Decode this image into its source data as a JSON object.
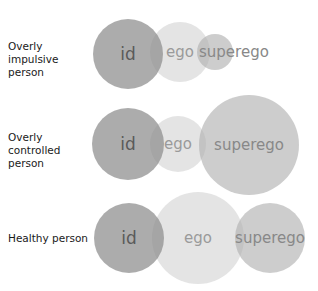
{
  "rows": [
    {
      "label": "Overly impulsive person",
      "label_lines": [
        "Overly impulsive",
        "person"
      ],
      "circles": {
        "id": {
          "text": "id",
          "cx": 128,
          "cy": 54,
          "r": 35
        },
        "ego": {
          "text": "ego",
          "cx": 180,
          "cy": 52,
          "r": 30
        },
        "superego": {
          "text": "superego",
          "cx": 215,
          "cy": 52,
          "r": 18
        }
      }
    },
    {
      "label": "Overly controlled person",
      "label_lines": [
        "Overly controlled",
        "person"
      ],
      "circles": {
        "id": {
          "text": "id",
          "cx": 128,
          "cy": 144,
          "r": 36
        },
        "ego": {
          "text": "ego",
          "cx": 178,
          "cy": 144,
          "r": 28
        },
        "superego": {
          "text": "superego",
          "cx": 249,
          "cy": 145,
          "r": 50
        }
      }
    },
    {
      "label": "Healthy person",
      "label_lines": [
        "Healthy person"
      ],
      "circles": {
        "id": {
          "text": "id",
          "cx": 129,
          "cy": 238,
          "r": 35
        },
        "ego": {
          "text": "ego",
          "cx": 198,
          "cy": 238,
          "r": 46
        },
        "superego": {
          "text": "superego",
          "cx": 270,
          "cy": 238,
          "r": 35
        }
      }
    }
  ],
  "colors": {
    "id_fill": "#8c8c8c",
    "ego_fill": "#e6e6e6",
    "superego_fill": "#c4c4c4",
    "id_text": "#5a5a5a",
    "ego_text": "#9a9a9a",
    "superego_text": "#888888"
  }
}
